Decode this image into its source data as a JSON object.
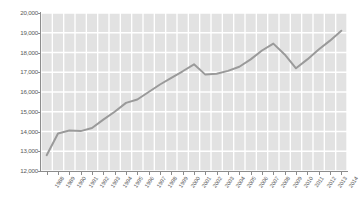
{
  "chart_data": {
    "type": "line",
    "title": "",
    "subtitle": "",
    "xlabel": "",
    "ylabel": "",
    "ylim": [
      12000,
      20000
    ],
    "ytick_labels": [
      "20,000",
      "19,000",
      "18,000",
      "17,000",
      "16,000",
      "15,000",
      "14,000",
      "13,000",
      "12,000"
    ],
    "ytick_values": [
      20000,
      19000,
      18000,
      17000,
      16000,
      15000,
      14000,
      13000,
      12000
    ],
    "grid": true,
    "grid_color": "#ffffff",
    "plot_background": "#e2e2e2",
    "legend": null,
    "legend_position": "none",
    "line_color": "#9a9a9a",
    "categories": [
      "1988",
      "1989",
      "1990",
      "1991",
      "1992",
      "1993",
      "1994",
      "1995",
      "1996",
      "1997",
      "1998",
      "1999",
      "2000",
      "2001",
      "2002",
      "2003",
      "2004",
      "2005",
      "2006",
      "2007",
      "2008",
      "2009",
      "2010",
      "2011",
      "2012",
      "2013",
      "2014"
    ],
    "series": [
      {
        "name": "series-1",
        "values": [
          12800,
          13900,
          14050,
          14020,
          14180,
          14600,
          15000,
          15450,
          15620,
          16000,
          16380,
          16720,
          17050,
          17400,
          16880,
          16920,
          17070,
          17280,
          17650,
          18100,
          18450,
          17900,
          17200,
          17650,
          18150,
          18600,
          19100
        ]
      }
    ]
  }
}
